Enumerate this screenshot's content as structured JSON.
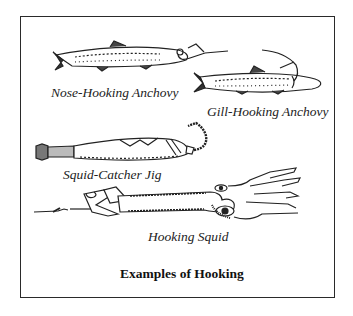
{
  "figure": {
    "title": "Examples of Hooking",
    "items": [
      {
        "label": "Nose-Hooking Anchovy",
        "icon": "anchovy-nose-hooked-illustration"
      },
      {
        "label": "Gill-Hooking Anchovy",
        "icon": "anchovy-gill-hooked-illustration"
      },
      {
        "label": "Squid-Catcher Jig",
        "icon": "squid-jig-illustration"
      },
      {
        "label": "Hooking Squid",
        "icon": "hooked-squid-illustration"
      }
    ],
    "colors": {
      "ink": "#222222",
      "background": "#ffffff"
    }
  }
}
